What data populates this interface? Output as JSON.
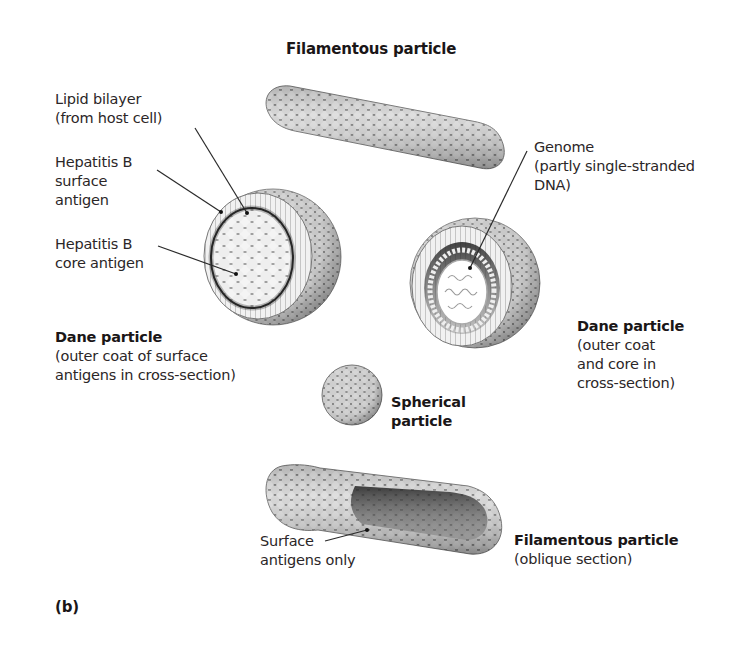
{
  "figure": {
    "panel_label": "(b)"
  },
  "labels": {
    "filamentous_top": {
      "title": "Filamentous particle"
    },
    "lipid_bilayer": {
      "lines": [
        "Lipid bilayer",
        "(from host cell)"
      ]
    },
    "surface_antigen": {
      "lines": [
        "Hepatitis B",
        "surface",
        "antigen"
      ]
    },
    "core_antigen": {
      "lines": [
        "Hepatitis B",
        "core antigen"
      ]
    },
    "dane_left": {
      "title": "Dane particle",
      "lines": [
        "(outer coat of surface",
        "antigens in cross-section)"
      ]
    },
    "genome": {
      "lines": [
        "Genome",
        "(partly single-stranded",
        "DNA)"
      ]
    },
    "dane_right": {
      "title": "Dane particle",
      "lines": [
        "(outer coat",
        "and core in",
        "cross-section)"
      ]
    },
    "spherical": {
      "lines": [
        "Spherical",
        "particle"
      ]
    },
    "surface_only": {
      "lines": [
        "Surface",
        "antigens only"
      ]
    },
    "filamentous_bottom": {
      "title": "Filamentous particle",
      "lines": [
        "(oblique section)"
      ]
    }
  },
  "colors": {
    "text": "#231f20",
    "particle_light": "#e6e6e6",
    "particle_mid": "#a8a8a8",
    "particle_dark": "#3a3a3a",
    "core_dark": "#111111",
    "background": "#ffffff"
  }
}
